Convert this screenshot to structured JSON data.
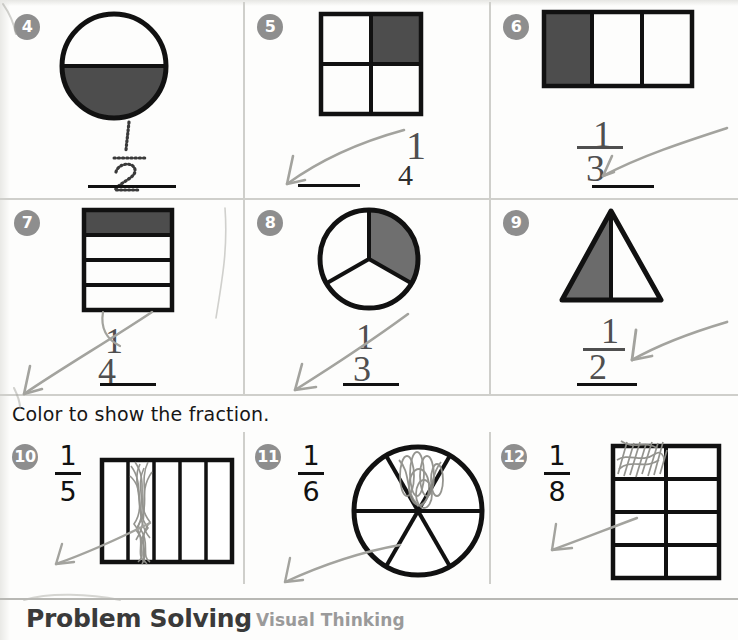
{
  "worksheet": {
    "instruction": "Color to show the fraction.",
    "footer_title": "Problem Solving",
    "footer_subtitle": "Visual Thinking",
    "shaded_color": "#4d4d4d",
    "badge_color": "#8e8e8e",
    "ink_color": "#111111",
    "pencil_color": "#9a9a96"
  },
  "section_top": {
    "title": "",
    "problems": [
      {
        "number": "4",
        "shape": "circle-halves",
        "parts": 2,
        "shaded": 1,
        "answer_mode": "trace",
        "numerator": "1",
        "denominator": "2",
        "handwritten": "",
        "has_answer_line": true
      },
      {
        "number": "5",
        "shape": "square-quarters",
        "parts": 4,
        "shaded": 1,
        "answer_mode": "blank",
        "numerator": "",
        "denominator": "4",
        "handwritten": "1",
        "has_answer_line": true
      },
      {
        "number": "6",
        "shape": "bar-thirds",
        "parts": 3,
        "shaded": 1,
        "answer_mode": "blank",
        "numerator": "",
        "denominator": "",
        "handwritten": "1/3",
        "has_answer_line": true
      },
      {
        "number": "7",
        "shape": "bar-fourths-vertical",
        "parts": 4,
        "shaded": 1,
        "answer_mode": "blank",
        "numerator": "",
        "denominator": "",
        "handwritten": "1/4",
        "has_answer_line": true
      },
      {
        "number": "8",
        "shape": "circle-thirds",
        "parts": 3,
        "shaded": 1,
        "answer_mode": "blank",
        "numerator": "",
        "denominator": "",
        "handwritten": "1/3",
        "has_answer_line": true
      },
      {
        "number": "9",
        "shape": "triangle-halves",
        "parts": 2,
        "shaded": 1,
        "answer_mode": "blank",
        "numerator": "",
        "denominator": "",
        "handwritten": "1/2",
        "has_answer_line": true
      }
    ]
  },
  "section_bottom": {
    "problems": [
      {
        "number": "10",
        "shape": "bar-fifths",
        "parts": 5,
        "numerator": "1",
        "denominator": "5",
        "colored_part": 2
      },
      {
        "number": "11",
        "shape": "circle-sixths",
        "parts": 6,
        "numerator": "1",
        "denominator": "6",
        "colored_part": 1
      },
      {
        "number": "12",
        "shape": "grid-eighths",
        "parts": 8,
        "numerator": "1",
        "denominator": "8",
        "colored_part": 1
      }
    ]
  }
}
